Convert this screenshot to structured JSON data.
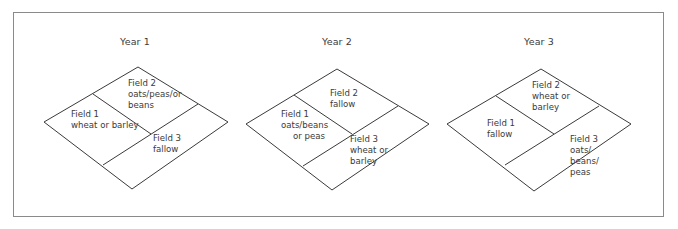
{
  "figure": {
    "line_color": "#3a3a3a",
    "frame_color": "#8a8a8a"
  },
  "years": [
    {
      "title": "Year 1",
      "fields": [
        {
          "name": "Field 1",
          "crop": [
            "wheat or barley"
          ]
        },
        {
          "name": "Field 2",
          "crop": [
            "oats/peas/or",
            "beans"
          ]
        },
        {
          "name": "Field 3",
          "crop": [
            "fallow"
          ]
        }
      ]
    },
    {
      "title": "Year 2",
      "fields": [
        {
          "name": "Field 1",
          "crop": [
            "oats/beans",
            "or peas"
          ]
        },
        {
          "name": "Field 2",
          "crop": [
            "fallow"
          ]
        },
        {
          "name": "Field 3",
          "crop": [
            "wheat or",
            "barley"
          ]
        }
      ]
    },
    {
      "title": "Year 3",
      "fields": [
        {
          "name": "Field 1",
          "crop": [
            "fallow"
          ]
        },
        {
          "name": "Field 2",
          "crop": [
            "wheat or",
            "barley"
          ]
        },
        {
          "name": "Field 3",
          "crop": [
            "oats/",
            "beans/",
            "peas"
          ]
        }
      ]
    }
  ]
}
